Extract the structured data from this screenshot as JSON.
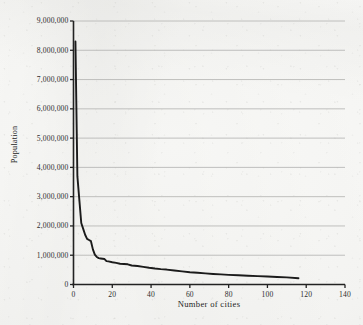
{
  "chart_data": {
    "type": "line",
    "title": "",
    "xlabel": "Number of cities",
    "ylabel": "Population",
    "xlim": [
      0,
      140
    ],
    "ylim": [
      0,
      9000000
    ],
    "grid": "horizontal",
    "legend": "none",
    "x_ticks": [
      "0",
      "20",
      "40",
      "60",
      "80",
      "100",
      "120",
      "140"
    ],
    "x_tick_values": [
      0,
      20,
      40,
      60,
      80,
      100,
      120,
      140
    ],
    "y_ticks": [
      "0",
      "1,000,000",
      "2,000,000",
      "3,000,000",
      "4,000,000",
      "5,000,000",
      "6,000,000",
      "7,000,000",
      "8,000,000",
      "9,000,000"
    ],
    "y_tick_values": [
      0,
      1000000,
      2000000,
      3000000,
      4000000,
      5000000,
      6000000,
      7000000,
      8000000,
      9000000
    ],
    "series": [
      {
        "name": "Population by city rank",
        "x": [
          1,
          2,
          3,
          4,
          5,
          6,
          7,
          8,
          9,
          10,
          11,
          12,
          13,
          14,
          15,
          16,
          17,
          18,
          20,
          22,
          24,
          26,
          28,
          30,
          33,
          36,
          39,
          42,
          45,
          48,
          52,
          56,
          60,
          64,
          68,
          72,
          76,
          80,
          85,
          90,
          95,
          100,
          105,
          110,
          116
        ],
        "y": [
          8300000,
          3700000,
          2900000,
          2100000,
          1900000,
          1700000,
          1560000,
          1520000,
          1480000,
          1200000,
          1020000,
          940000,
          900000,
          890000,
          880000,
          870000,
          800000,
          790000,
          760000,
          740000,
          710000,
          700000,
          690000,
          650000,
          630000,
          600000,
          570000,
          545000,
          525000,
          510000,
          480000,
          450000,
          420000,
          400000,
          380000,
          360000,
          345000,
          330000,
          315000,
          300000,
          285000,
          272000,
          258000,
          245000,
          215000
        ]
      }
    ],
    "colors": {
      "line": "#1b1b1b",
      "axis": "#222222",
      "grid": "#b9b9b7",
      "background": "#f7f7f5",
      "text": "#2d2d2d"
    }
  }
}
